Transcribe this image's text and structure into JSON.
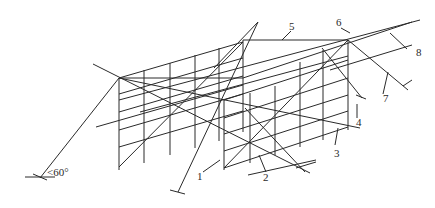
{
  "figure": {
    "type": "scaffold-perspective-sketch",
    "labels": [
      {
        "id": "label-1",
        "text": "1",
        "x": 197,
        "y": 180
      },
      {
        "id": "label-2",
        "text": "2",
        "x": 263,
        "y": 181
      },
      {
        "id": "label-3",
        "text": "3",
        "x": 334,
        "y": 157
      },
      {
        "id": "label-4",
        "text": "4",
        "x": 356,
        "y": 126
      },
      {
        "id": "label-5",
        "text": "5",
        "x": 289,
        "y": 30
      },
      {
        "id": "label-6",
        "text": "6",
        "x": 336,
        "y": 26
      },
      {
        "id": "label-7",
        "text": "7",
        "x": 383,
        "y": 102
      },
      {
        "id": "label-8",
        "text": "8",
        "x": 416,
        "y": 56
      }
    ],
    "angle_annotation": {
      "text": "<60°",
      "x": 47,
      "y": 176
    }
  }
}
